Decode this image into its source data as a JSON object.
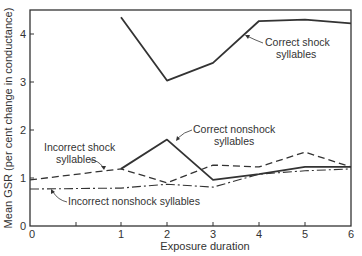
{
  "chart_data": {
    "type": "line",
    "title": "",
    "xlabel": "Exposure duration",
    "ylabel": "Mean GSR (per cent change in conductance)",
    "xlim": [
      0,
      6
    ],
    "ylim": [
      0,
      4.5
    ],
    "x_ticks": [
      "0",
      "1",
      "2",
      "3",
      "4",
      "5",
      "6"
    ],
    "y_ticks": [
      "0",
      "1",
      "2",
      "3",
      "4"
    ],
    "grid": false,
    "legend": "inline annotations",
    "series": [
      {
        "name": "Correct shock syllables",
        "style": "solid",
        "x": [
          1,
          2,
          3,
          4,
          5,
          6
        ],
        "values": [
          4.35,
          3.03,
          3.4,
          4.27,
          4.3,
          4.22
        ]
      },
      {
        "name": "Correct nonshock syllables",
        "style": "solid",
        "x": [
          1,
          2,
          3,
          4,
          5,
          6
        ],
        "values": [
          1.19,
          1.8,
          0.96,
          1.08,
          1.23,
          1.23
        ]
      },
      {
        "name": "Incorrect shock syllables",
        "style": "dashed",
        "x": [
          0,
          1,
          2,
          3,
          4,
          5,
          6
        ],
        "values": [
          0.96,
          1.19,
          0.9,
          1.27,
          1.23,
          1.54,
          1.23
        ]
      },
      {
        "name": "Incorrect nonshock syllables",
        "style": "dash-dot",
        "x": [
          0,
          1,
          2,
          3,
          4,
          5,
          6
        ],
        "values": [
          0.77,
          0.79,
          0.87,
          0.81,
          1.08,
          1.15,
          1.19
        ]
      }
    ]
  },
  "labels": {
    "correct_shock_1": "Correct shock",
    "correct_shock_2": "syllables",
    "correct_nonshock_1": "Correct nonshock",
    "correct_nonshock_2": "syllables",
    "incorrect_shock_1": "Incorrect shock",
    "incorrect_shock_2": "syllables",
    "incorrect_nonshock": "Incorrect nonshock syllables"
  }
}
